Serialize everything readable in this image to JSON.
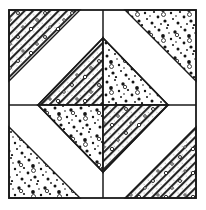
{
  "figure": {
    "name": "quilt-block-pattern",
    "title": "",
    "background_color": "#ffffff",
    "line_color": "#1a1a1a",
    "fill_plain_color": "#ffffff",
    "hatch_color": "#222222",
    "stipple_color": "#1a1a1a",
    "frame": {
      "x": 9,
      "y": 10,
      "width": 187,
      "height": 188,
      "stroke_width": 1.6
    },
    "center": {
      "x": 103,
      "y": 105
    },
    "center_cross": {
      "vertical": {
        "x": 103,
        "y1": 10,
        "y2": 198
      },
      "horizontal": {
        "y": 105,
        "x1": 9,
        "x2": 196
      }
    },
    "diamond": {
      "label": "center-diamond",
      "vertices": [
        {
          "x": 103,
          "y": 38
        },
        {
          "x": 168,
          "y": 105
        },
        {
          "x": 103,
          "y": 172
        },
        {
          "x": 38,
          "y": 105
        }
      ],
      "sections": [
        {
          "name": "diamond-top-left",
          "fill": "hatch",
          "points": "103,38 103,105 38,105"
        },
        {
          "name": "diamond-top-right",
          "fill": "stipple",
          "points": "103,38 168,105 103,105"
        },
        {
          "name": "diamond-bottom-left",
          "fill": "stipple",
          "points": "38,105 103,105 103,172"
        },
        {
          "name": "diamond-bottom-right",
          "fill": "hatch",
          "points": "103,105 168,105 103,172"
        }
      ]
    },
    "corner_triangles": [
      {
        "name": "corner-triangle-top-left",
        "fill": "hatch",
        "points": "9,10 80,10 9,81"
      },
      {
        "name": "corner-triangle-top-right",
        "fill": "stipple",
        "points": "196,10 196,81 125,10"
      },
      {
        "name": "corner-triangle-bottom-left",
        "fill": "stipple",
        "points": "9,198 9,127 80,198"
      },
      {
        "name": "corner-triangle-bottom-right",
        "fill": "hatch",
        "points": "196,198 125,198 196,127"
      }
    ],
    "white_bands": [
      {
        "name": "white-band-top-left",
        "points": "80,10 103,10 103,38 38,105 9,105 9,81"
      },
      {
        "name": "white-band-top-right",
        "points": "125,10 103,10 103,38 168,105 196,105 196,81"
      },
      {
        "name": "white-band-bottom-left",
        "points": "80,198 103,198 103,172 38,105 9,105 9,127"
      },
      {
        "name": "white-band-bottom-right",
        "points": "125,198 103,198 103,172 168,105 196,105 196,127"
      }
    ],
    "quadrants": [
      {
        "name": "quadrant-top-left",
        "corner_fill": "hatch",
        "diamond_fill": "hatch"
      },
      {
        "name": "quadrant-top-right",
        "corner_fill": "stipple",
        "diamond_fill": "stipple"
      },
      {
        "name": "quadrant-bottom-left",
        "corner_fill": "stipple",
        "diamond_fill": "stipple"
      },
      {
        "name": "quadrant-bottom-right",
        "corner_fill": "hatch",
        "diamond_fill": "hatch"
      }
    ]
  }
}
